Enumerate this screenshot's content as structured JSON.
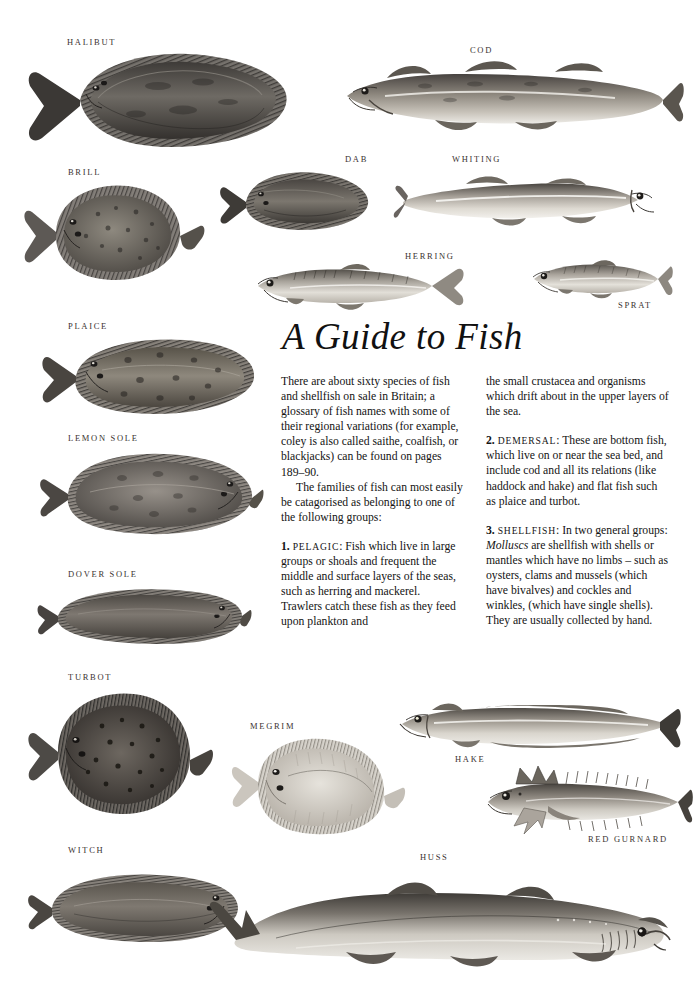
{
  "page": {
    "title": "A Guide to Fish",
    "background_color": "#ffffff",
    "label_color": "#3a3230",
    "text_color": "#141414"
  },
  "specimens": [
    {
      "name": "halibut",
      "label": "HALIBUT",
      "x": 67,
      "y": 38
    },
    {
      "name": "cod",
      "label": "COD",
      "x": 470,
      "y": 46
    },
    {
      "name": "brill",
      "label": "BRILL",
      "x": 68,
      "y": 168
    },
    {
      "name": "dab",
      "label": "DAB",
      "x": 345,
      "y": 155
    },
    {
      "name": "whiting",
      "label": "WHITING",
      "x": 452,
      "y": 155
    },
    {
      "name": "herring",
      "label": "HERRING",
      "x": 405,
      "y": 252
    },
    {
      "name": "sprat",
      "label": "SPRAT",
      "x": 618,
      "y": 301
    },
    {
      "name": "plaice",
      "label": "PLAICE",
      "x": 68,
      "y": 322
    },
    {
      "name": "lemon-sole",
      "label": "LEMON SOLE",
      "x": 68,
      "y": 434
    },
    {
      "name": "dover-sole",
      "label": "DOVER SOLE",
      "x": 68,
      "y": 570
    },
    {
      "name": "turbot",
      "label": "TURBOT",
      "x": 68,
      "y": 673
    },
    {
      "name": "megrim",
      "label": "MEGRIM",
      "x": 250,
      "y": 722
    },
    {
      "name": "hake",
      "label": "HAKE",
      "x": 455,
      "y": 755
    },
    {
      "name": "red-gurnard",
      "label": "RED GURNARD",
      "x": 588,
      "y": 835
    },
    {
      "name": "witch",
      "label": "WITCH",
      "x": 68,
      "y": 846
    },
    {
      "name": "huss",
      "label": "HUSS",
      "x": 420,
      "y": 853
    }
  ],
  "article": {
    "heading": "A Guide to Fish",
    "left_column": {
      "para1": "There are about sixty species of fish and shellfish on sale in Britain; a glossary of fish names with some of their regional variations (for example, coley is also called saithe, coalfish, or blackjacks) can be found on pages 189–90.",
      "para2": "The families of fish can most easily be catagorised as belonging to one of the following groups:",
      "item1_number": "1.",
      "item1_term": "Pelagic",
      "item1_text": ": Fish which live in large groups or shoals and frequent the middle and surface layers of the seas, such as herring and mackerel. Trawlers catch these fish as they feed upon plankton and"
    },
    "right_column": {
      "para1_continued": "the small crustacea and organisms which drift about in the upper layers of the sea.",
      "item2_number": "2.",
      "item2_term": "Demersal",
      "item2_text": ": These are bottom fish, which live on or near the sea bed, and include cod and all its relations (like haddock and hake) and flat fish such as plaice and turbot.",
      "item3_number": "3.",
      "item3_term": "Shellfish",
      "item3_text_before": ": In two general groups: ",
      "item3_italic": "Molluscs",
      "item3_text_after": " are shellfish with shells or mantles which have no limbs – such as oysters, clams and mussels (which have bivalves) and cockles and winkles, (which have single shells). They are usually collected by hand."
    }
  }
}
